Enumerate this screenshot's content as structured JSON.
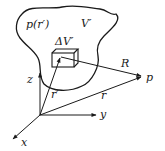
{
  "diagram": {
    "type": "vector-geometry",
    "region": {
      "charge_density_label": "p(r′)",
      "volume_label": "V′"
    },
    "volume_element": {
      "label": "ΔV′"
    },
    "vectors": {
      "source_position": "r′",
      "field_position": "r",
      "separation": "R"
    },
    "field_point": {
      "label": "p"
    },
    "axes": {
      "x": "x",
      "y": "y",
      "z": "z"
    },
    "colors": {
      "stroke": "#1a1a1a",
      "background": "#ffffff"
    }
  }
}
